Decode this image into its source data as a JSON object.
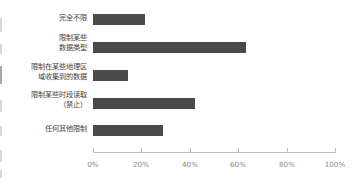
{
  "chart_data": {
    "type": "bar",
    "orientation": "horizontal",
    "title": "",
    "subtitle": "",
    "xlabel": "",
    "ylabel": "",
    "xlim": [
      0,
      100
    ],
    "grid": false,
    "legend": null,
    "bar_color": "#4a4a4a",
    "axis_color": "#bcbcbc",
    "tick_label_color": "#8a8a8a",
    "category_label_color": "#3f3f3f",
    "categories": [
      "完全不限",
      "限制某些数据类型",
      "限制在某些地理区域收集到的数据",
      "限制某些时段读取（禁止）",
      "任何其他限制"
    ],
    "category_lines": [
      [
        "完全不限"
      ],
      [
        "限制某些",
        "数据类型"
      ],
      [
        "限制在某些地理区",
        "域收集到的数据"
      ],
      [
        "限制某些时段读取",
        "（禁止）"
      ],
      [
        "任何其他限制"
      ]
    ],
    "values": [
      21.4,
      63.0,
      14.4,
      42.0,
      28.8
    ],
    "value_unit": "%",
    "xticks": [
      0,
      20,
      40,
      60,
      80,
      100
    ],
    "xticklabels": [
      "0%",
      "20%",
      "40%",
      "60%",
      "80%",
      "100%"
    ]
  }
}
